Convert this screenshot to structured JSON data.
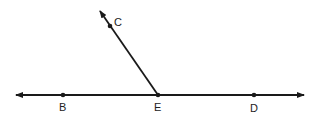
{
  "diagram": {
    "type": "geometry-rays",
    "points": [
      {
        "id": "B",
        "label": "B"
      },
      {
        "id": "E",
        "label": "E"
      },
      {
        "id": "D",
        "label": "D"
      },
      {
        "id": "C",
        "label": "C"
      }
    ],
    "lines": [
      {
        "name": "line-BD",
        "through": [
          "B",
          "E",
          "D"
        ],
        "arrows": "both"
      },
      {
        "name": "ray-EC",
        "from": "E",
        "through": "C",
        "arrows": "end"
      }
    ],
    "colors": {
      "stroke": "#1a1a1a",
      "text": "#222222",
      "background": "#ffffff"
    }
  }
}
